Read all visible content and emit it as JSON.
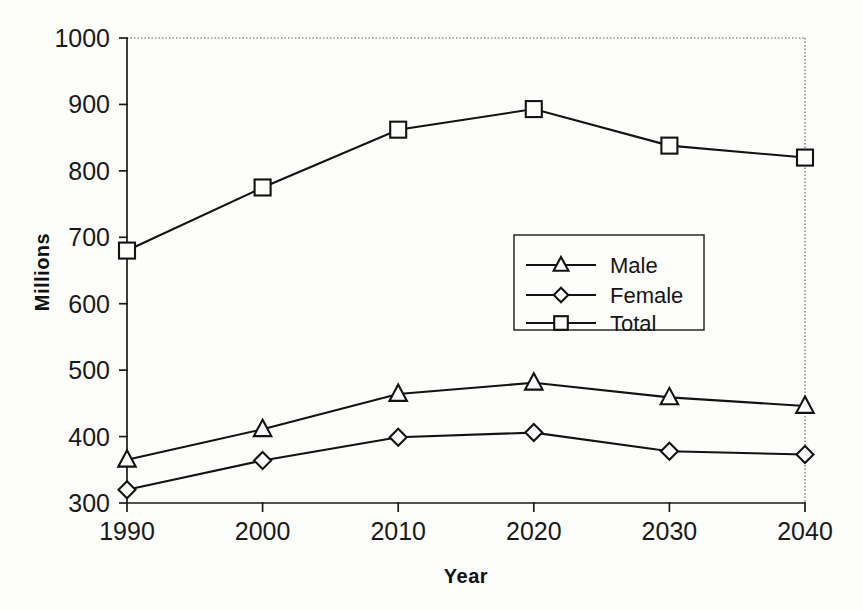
{
  "chart_data": {
    "type": "line",
    "title": "",
    "xlabel": "Year",
    "ylabel": "Millions",
    "categories": [
      "1990",
      "2000",
      "2010",
      "2020",
      "2030",
      "2040"
    ],
    "x": [
      1990,
      2000,
      2010,
      2020,
      2030,
      2040
    ],
    "xlim": [
      1990,
      2040
    ],
    "ylim": [
      300,
      1000
    ],
    "yticks": [
      "300",
      "400",
      "500",
      "600",
      "700",
      "800",
      "900",
      "1000"
    ],
    "ytick_values": [
      300,
      400,
      500,
      600,
      700,
      800,
      900,
      1000
    ],
    "grid": false,
    "legend_position": "center-right-inside",
    "series": [
      {
        "name": "Male",
        "marker": "triangle",
        "values": [
          365,
          411,
          464,
          481,
          459,
          446
        ]
      },
      {
        "name": "Female",
        "marker": "diamond",
        "values": [
          320,
          364,
          399,
          406,
          378,
          373
        ]
      },
      {
        "name": "Total",
        "marker": "square",
        "values": [
          680,
          775,
          862,
          893,
          838,
          820
        ]
      }
    ],
    "colors": {
      "line": "#131313",
      "marker_fill": "#fdfdfb",
      "background": "#fdfdfb",
      "axis": "#1b1b1b",
      "border_dotted": "#8d8d8d"
    }
  },
  "axes": {
    "y_title": "Millions",
    "x_title": "Year"
  },
  "legend": {
    "entries": [
      {
        "label": "Male"
      },
      {
        "label": "Female"
      },
      {
        "label": "Total"
      }
    ]
  }
}
